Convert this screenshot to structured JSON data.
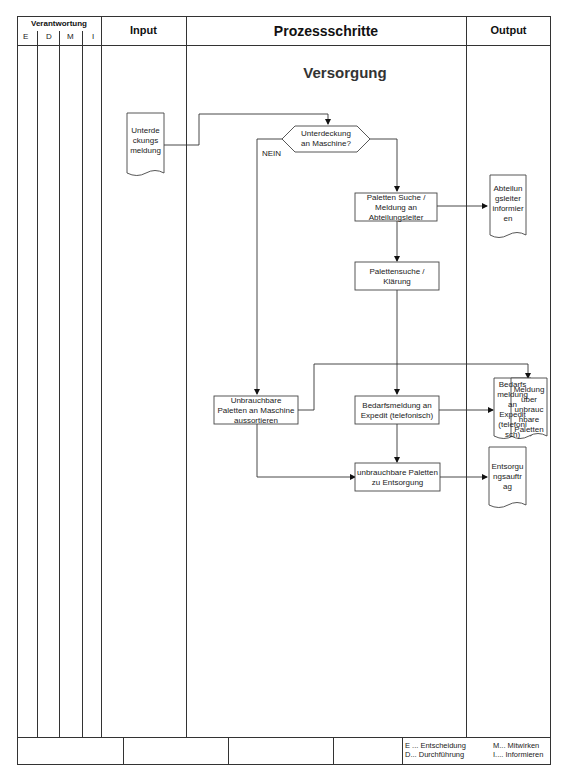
{
  "header": {
    "responsibility_title": "Verantwortung",
    "responsibility_cols": [
      "E",
      "D",
      "M",
      "I"
    ],
    "input_title": "Input",
    "process_title": "Prozessschritte",
    "output_title": "Output"
  },
  "diagram": {
    "section_title": "Versorgung",
    "input_doc": "Unterde ckungs meldung",
    "input_doc_lines": [
      "Unterde",
      "ckungs",
      "meldung"
    ],
    "decision": {
      "lines": [
        "Unterdeckung",
        "an Maschine?"
      ]
    },
    "no_label": "NEIN",
    "step_paletten_suche": {
      "lines": [
        "Paletten Suche /",
        "Meldung an",
        "Abteilungsleiter"
      ]
    },
    "step_palettensuche_klaerung": {
      "lines": [
        "Palettensuche /",
        "Klärung"
      ]
    },
    "step_unbrauchbare_aussortieren": {
      "lines": [
        "Unbrauchbare",
        "Paletten an Maschine",
        "aussortieren"
      ]
    },
    "step_bedarfsmeldung": {
      "lines": [
        "Bedarfsmeldung an",
        "Expedit (telefonisch)"
      ]
    },
    "step_entsorgung": {
      "lines": [
        "unbrauchbare Paletten",
        "zu Entsorgung"
      ]
    },
    "output_abteilungsleiter": {
      "lines": [
        "Abteilun",
        "gsleiter",
        "informier",
        "en"
      ]
    },
    "output_bedarfsmeldung": {
      "lines": [
        "Bedarfs",
        "meldung",
        "an",
        "Expedit",
        "(telefoni",
        "sch)"
      ]
    },
    "output_meldung_unbrauchbar": {
      "lines": [
        "Meldung",
        "über",
        "unbrauc",
        "hbare",
        "Paletten"
      ]
    },
    "output_entsorgungsauftrag": {
      "lines": [
        "Entsorgu",
        "ngsauftr",
        "ag"
      ]
    }
  },
  "legend": {
    "e": "E ... Entscheidung",
    "d": "D... Durchführung",
    "m": "M... Mitwirken",
    "i": "I.... Informieren"
  }
}
